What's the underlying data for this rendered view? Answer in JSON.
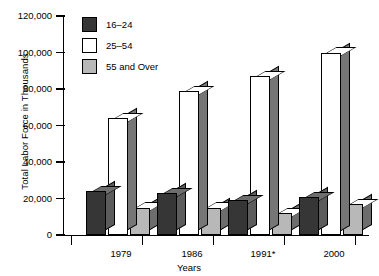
{
  "chart_data": {
    "type": "bar",
    "title": "",
    "xlabel": "Years",
    "ylabel": "Total Labor Force in Thousands",
    "categories": [
      "1979",
      "1986",
      "1991*",
      "2000"
    ],
    "ylim": [
      0,
      120000
    ],
    "yticks": [
      0,
      20000,
      40000,
      60000,
      80000,
      100000,
      120000
    ],
    "ytick_labels": [
      "0",
      "20,000",
      "40,000",
      "60,000",
      "80,000",
      "100,000",
      "120,000"
    ],
    "grid": false,
    "legend_position": "top-left",
    "series": [
      {
        "name": "16–24",
        "color": "#363636",
        "values": [
          24000,
          23000,
          19000,
          21000
        ]
      },
      {
        "name": "25–54",
        "color": "#ffffff",
        "values": [
          64000,
          79000,
          87000,
          100000
        ]
      },
      {
        "name": "55 and Over",
        "color": "#b8b8b8",
        "values": [
          15000,
          15000,
          12000,
          17000
        ]
      }
    ]
  },
  "legend": {
    "items": [
      {
        "label": "16–24"
      },
      {
        "label": "25–54"
      },
      {
        "label": "55 and Over"
      }
    ]
  }
}
